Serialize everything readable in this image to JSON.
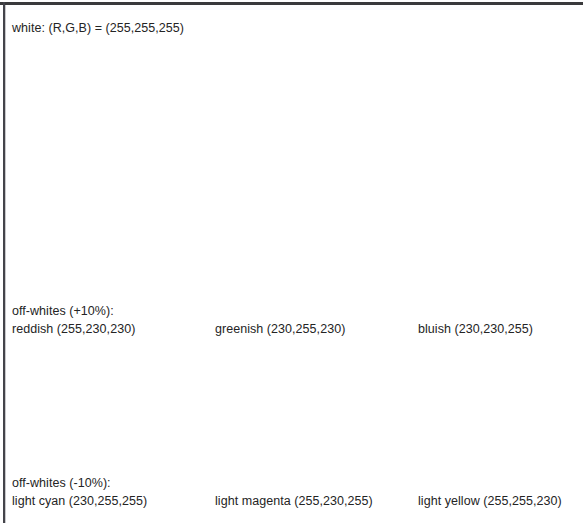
{
  "document": {
    "title_line": "white: (R,G,B) = (255,255,255)",
    "background_color": "#ffffff",
    "text_color": "#242424",
    "border_color": "#3a3a3c"
  },
  "groups": [
    {
      "label": "off-whites (+10%):",
      "entries": [
        {
          "name": "reddish",
          "rgb": "(255,230,230)",
          "text": "reddish (255,230,230)",
          "swatch": "#ffe6e6"
        },
        {
          "name": "greenish",
          "rgb": "(230,255,230)",
          "text": "greenish (230,255,230)",
          "swatch": "#e6ffe6"
        },
        {
          "name": "bluish",
          "rgb": "(230,230,255)",
          "text": "bluish (230,230,255)",
          "swatch": "#e6e6ff"
        }
      ]
    },
    {
      "label": "off-whites (-10%):",
      "entries": [
        {
          "name": "light cyan",
          "rgb": "(230,255,255)",
          "text": "light cyan (230,255,255)",
          "swatch": "#e6ffff"
        },
        {
          "name": "light magenta",
          "rgb": "(255,230,255)",
          "text": "light magenta (255,230,255)",
          "swatch": "#ffe6ff"
        },
        {
          "name": "light yellow",
          "rgb": "(255,255,230)",
          "text": "light yellow (255,255,230)",
          "swatch": "#ffffe6"
        }
      ]
    }
  ]
}
